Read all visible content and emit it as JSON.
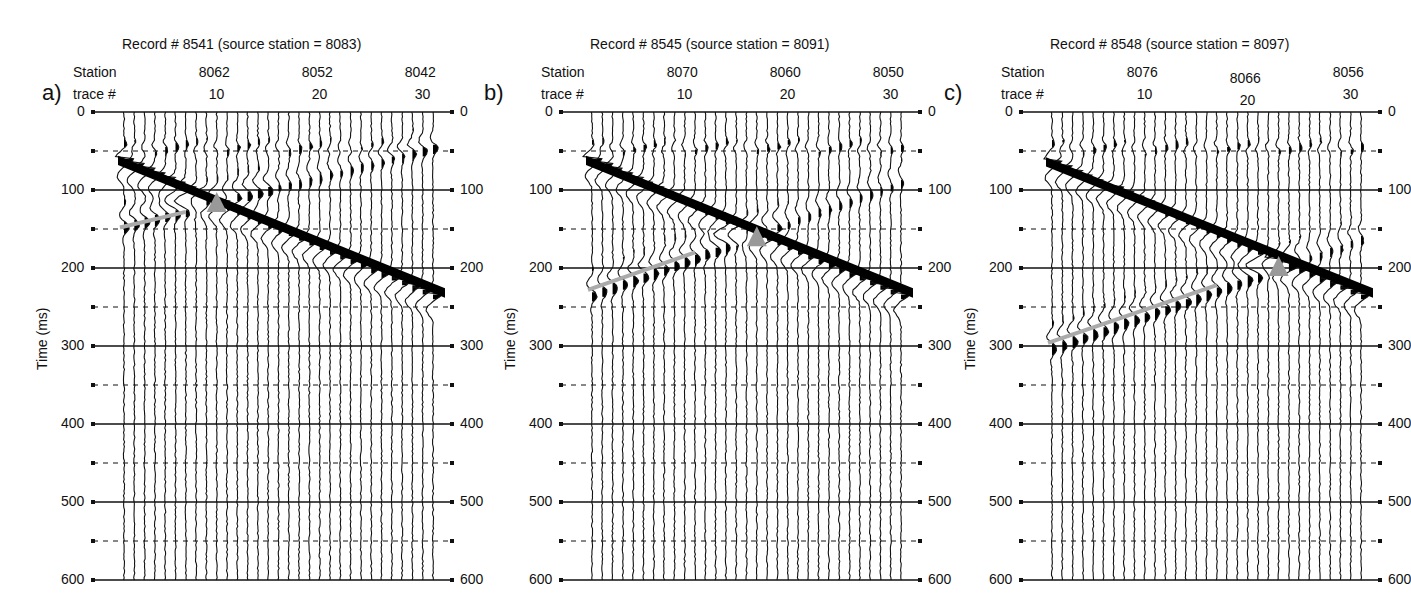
{
  "figure": {
    "panels": [
      {
        "letter": "a)",
        "title": "Record # 8541 (source station = 8083)",
        "station_label": "Station",
        "trace_label": "trace #",
        "stations": [
          "8062",
          "8052",
          "8042"
        ],
        "traces": [
          "10",
          "20",
          "30"
        ],
        "offset_x": 0,
        "triangle": {
          "trace": 9,
          "time": 118
        },
        "gray_line": {
          "t0": 148,
          "t1": 128,
          "trace0": 0,
          "trace1": 6
        },
        "first_arrival": {
          "t_start": 60,
          "t_end": 232
        },
        "refl_t0": 140
      },
      {
        "letter": "b)",
        "title": "Record # 8545 (source station = 8091)",
        "station_label": "Station",
        "trace_label": "trace #",
        "stations": [
          "8070",
          "8060",
          "8050"
        ],
        "traces": [
          "10",
          "20",
          "30"
        ],
        "offset_x": 468,
        "triangle": {
          "trace": 16,
          "time": 162
        },
        "gray_line": {
          "t0": 228,
          "t1": 180,
          "trace0": 0,
          "trace1": 10
        },
        "first_arrival": {
          "t_start": 60,
          "t_end": 232
        },
        "refl_t0": 228
      },
      {
        "letter": "c)",
        "title": "Record # 8548 (source station = 8097)",
        "station_label": "Station",
        "trace_label": "trace #",
        "stations": [
          "8076",
          "8066",
          "8056"
        ],
        "traces": [
          "10",
          "20",
          "30"
        ],
        "offset_x": 928,
        "triangle": {
          "trace": 22,
          "time": 200
        },
        "gray_line": {
          "t0": 296,
          "t1": 222,
          "trace0": 0,
          "trace1": 16
        },
        "first_arrival": {
          "t_start": 62,
          "t_end": 232
        },
        "refl_t0": 296
      }
    ],
    "y_axis_label": "Time (ms)",
    "y_ticks": [
      "0",
      "100",
      "200",
      "300",
      "400",
      "500",
      "600"
    ]
  },
  "chart_data": [
    {
      "type": "seismic-wiggle",
      "title": "Record # 8541 (source station = 8083)",
      "xlabel": "trace # / Station",
      "ylabel": "Time (ms)",
      "ylim": [
        0,
        600
      ],
      "x_ticks": {
        "trace": [
          10,
          20,
          30
        ],
        "station": [
          8062,
          8052,
          8042
        ]
      },
      "num_traces": 31,
      "grid": {
        "solid_ms": [
          0,
          100,
          200,
          300,
          400,
          500,
          600
        ],
        "dashed_ms": [
          50,
          150,
          250,
          350,
          450,
          550
        ]
      },
      "annotations": [
        {
          "type": "triangle",
          "trace": 9,
          "time_ms": 118
        },
        {
          "type": "gray_line",
          "from": [
            1,
            148
          ],
          "to": [
            7,
            128
          ]
        }
      ]
    },
    {
      "type": "seismic-wiggle",
      "title": "Record # 8545 (source station = 8091)",
      "xlabel": "trace # / Station",
      "ylabel": "Time (ms)",
      "ylim": [
        0,
        600
      ],
      "x_ticks": {
        "trace": [
          10,
          20,
          30
        ],
        "station": [
          8070,
          8060,
          8050
        ]
      },
      "num_traces": 31,
      "grid": {
        "solid_ms": [
          0,
          100,
          200,
          300,
          400,
          500,
          600
        ],
        "dashed_ms": [
          50,
          150,
          250,
          350,
          450,
          550
        ]
      },
      "annotations": [
        {
          "type": "triangle",
          "trace": 16,
          "time_ms": 162
        },
        {
          "type": "gray_line",
          "from": [
            1,
            228
          ],
          "to": [
            11,
            180
          ]
        }
      ]
    },
    {
      "type": "seismic-wiggle",
      "title": "Record # 8548 (source station = 8097)",
      "xlabel": "trace # / Station",
      "ylabel": "Time (ms)",
      "ylim": [
        0,
        600
      ],
      "x_ticks": {
        "trace": [
          10,
          20,
          30
        ],
        "station": [
          8076,
          8066,
          8056
        ]
      },
      "num_traces": 31,
      "grid": {
        "solid_ms": [
          0,
          100,
          200,
          300,
          400,
          500,
          600
        ],
        "dashed_ms": [
          50,
          150,
          250,
          350,
          450,
          550
        ]
      },
      "annotations": [
        {
          "type": "triangle",
          "trace": 22,
          "time_ms": 200
        },
        {
          "type": "gray_line",
          "from": [
            1,
            296
          ],
          "to": [
            17,
            222
          ]
        }
      ]
    }
  ]
}
